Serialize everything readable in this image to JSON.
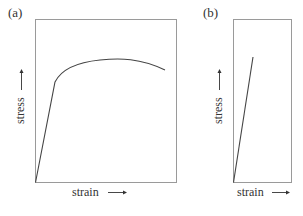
{
  "figure": {
    "panels": [
      {
        "id": "a",
        "label": "(a)",
        "xlabel": "strain",
        "ylabel": "stress",
        "description": "Stress-strain curve: linear elastic rise then yielding to a rounded maximum and slight decline (ductile material)"
      },
      {
        "id": "b",
        "label": "(b)",
        "xlabel": "strain",
        "ylabel": "stress",
        "description": "Stress-strain curve: straight linear rise ending abruptly (brittle material)"
      }
    ],
    "colors": {
      "frame": "#9a9a9a",
      "curve": "#444444",
      "text": "#333333"
    }
  }
}
